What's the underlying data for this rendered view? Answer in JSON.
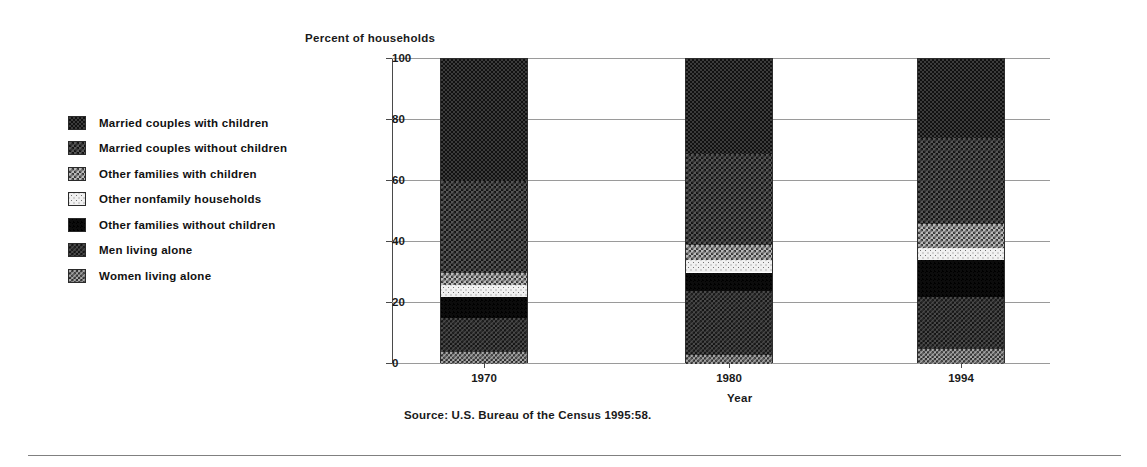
{
  "chart_data": {
    "type": "bar",
    "stacked": true,
    "title": "Percent of households",
    "xlabel": "Year",
    "ylabel": "Percent of households",
    "categories": [
      "1970",
      "1980",
      "1994"
    ],
    "ylim": [
      0,
      100
    ],
    "yticks": [
      0,
      20,
      40,
      60,
      80,
      100
    ],
    "grid": true,
    "legend_position": "left",
    "source": "Source: U.S. Bureau of the Census 1995:58.",
    "series": [
      {
        "name": "Married couples with children",
        "pattern": "pat-mcwith",
        "values": [
          40,
          31,
          26
        ]
      },
      {
        "name": "Married couples without children",
        "pattern": "pat-mcwithout",
        "values": [
          30,
          30,
          28
        ]
      },
      {
        "name": "Other families with children",
        "pattern": "pat-ofwith",
        "values": [
          4,
          5,
          8
        ]
      },
      {
        "name": "Other nonfamily households",
        "pattern": "pat-onf",
        "values": [
          4,
          4,
          4
        ]
      },
      {
        "name": "Other families without children",
        "pattern": "pat-ofwithout",
        "values": [
          7,
          6,
          12
        ]
      },
      {
        "name": "Men living alone",
        "pattern": "pat-men",
        "values": [
          11,
          21,
          17
        ]
      },
      {
        "name": "Women living alone",
        "pattern": "pat-women",
        "values": [
          4,
          3,
          5
        ]
      }
    ]
  },
  "legend": {
    "items": [
      {
        "label": "Married couples with children",
        "pattern": "pat-mcwith"
      },
      {
        "label": "Married couples without children",
        "pattern": "pat-mcwithout"
      },
      {
        "label": "Other families with children",
        "pattern": "pat-ofwith"
      },
      {
        "label": "Other nonfamily households",
        "pattern": "pat-onf"
      },
      {
        "label": "Other families without children",
        "pattern": "pat-ofwithout"
      },
      {
        "label": "Men living alone",
        "pattern": "pat-men"
      },
      {
        "label": "Women living alone",
        "pattern": "pat-women"
      }
    ]
  }
}
